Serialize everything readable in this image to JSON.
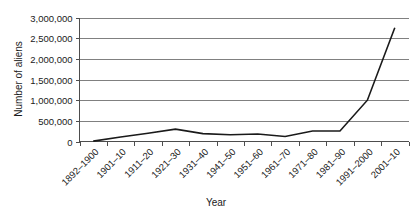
{
  "chart_data": {
    "type": "line",
    "title": "",
    "xlabel": "Year",
    "ylabel": "Number of aliens",
    "categories": [
      "1892–1900",
      "1901–10",
      "1911–20",
      "1921–30",
      "1931–40",
      "1941–50",
      "1951–60",
      "1961–70",
      "1971–80",
      "1981–90",
      "1991–2000",
      "2001–10"
    ],
    "values": [
      10000,
      110000,
      200000,
      300000,
      190000,
      165000,
      180000,
      120000,
      255000,
      255000,
      1000000,
      2750000
    ],
    "ylim": [
      0,
      3000000
    ],
    "yticks": [
      0,
      500000,
      1000000,
      1500000,
      2000000,
      2500000,
      3000000
    ],
    "ytick_labels": [
      "0",
      "500,000",
      "1,000,000",
      "1,500,000",
      "2,000,000",
      "2,500,000",
      "3,000,000"
    ],
    "grid": true,
    "legend": "none",
    "series_color": "#1a1a1a",
    "grid_color": "#808080"
  }
}
